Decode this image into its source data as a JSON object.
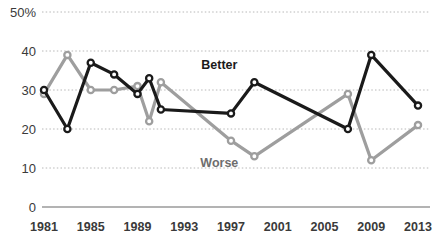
{
  "chart_data": {
    "type": "line",
    "title": "",
    "xlabel": "",
    "ylabel": "",
    "ylim": [
      0,
      50
    ],
    "xlim": [
      1981,
      2013
    ],
    "grid": true,
    "grid_style": "dotted-horizontal",
    "legend_position": "inline-annotation",
    "y_ticks": [
      "50%",
      "40",
      "30",
      "20",
      "10",
      "0"
    ],
    "y_tick_values": [
      50,
      40,
      30,
      20,
      10,
      0
    ],
    "x_ticks": [
      "1981",
      "1985",
      "1989",
      "1993",
      "1997",
      "2001",
      "2005",
      "2009",
      "2013"
    ],
    "x_tick_values": [
      1981,
      1985,
      1989,
      1993,
      1997,
      2001,
      2005,
      2009,
      2013
    ],
    "series": [
      {
        "name": "Better",
        "color": "#1a1a1a",
        "label_color": "#1a1a1a",
        "label_x": 1996,
        "label_y": 35.5,
        "x": [
          1981,
          1983,
          1985,
          1987,
          1989,
          1990,
          1991,
          1997,
          1999,
          2007,
          2009,
          2013
        ],
        "values": [
          30,
          20,
          37,
          34,
          29,
          33,
          25,
          24,
          32,
          20,
          39,
          26
        ]
      },
      {
        "name": "Worse",
        "color": "#9e9e9e",
        "label_color": "#6e6e6e",
        "label_x": 1996,
        "label_y": 10.2,
        "x": [
          1981,
          1983,
          1985,
          1987,
          1989,
          1990,
          1991,
          1997,
          1999,
          2007,
          2009,
          2013
        ],
        "values": [
          29,
          39,
          30,
          30,
          31,
          22,
          32,
          17,
          13,
          29,
          12,
          21
        ]
      }
    ]
  },
  "axis": {
    "baseline_color": "#9a9a9a",
    "gridline_color": "#b8b8b8"
  }
}
